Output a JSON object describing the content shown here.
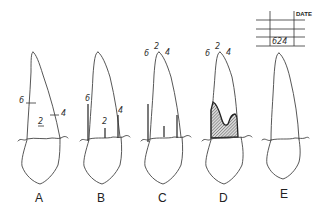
{
  "figure": {
    "panels": [
      {
        "label": "A",
        "depth_labels": {
          "mesial": "6",
          "center": "2",
          "distal": "4"
        },
        "depiction": "pocket depths marked as ticks on root"
      },
      {
        "label": "B",
        "depth_labels": {
          "mesial": "6",
          "center": "2",
          "distal": "4"
        },
        "depiction": "probes inserted at three sites"
      },
      {
        "label": "C",
        "depth_labels": {
          "mesial": "6",
          "center": "2",
          "distal": "4"
        },
        "depiction": "probe depths with readings at apex"
      },
      {
        "label": "D",
        "depth_labels": {
          "mesial": "6",
          "center": "2",
          "distal": "4"
        },
        "depiction": "shaded pocket area"
      },
      {
        "label": "E",
        "depiction": "readings recorded in chart"
      }
    ],
    "chart": {
      "header": "DATE",
      "entry": "624"
    }
  }
}
